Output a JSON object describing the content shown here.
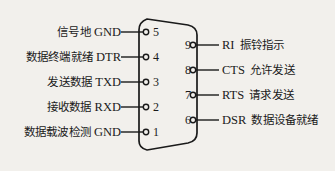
{
  "diagram": {
    "connector": {
      "shape": "d-sub-9-outline",
      "stroke_color": "#1a1a1a",
      "fill_color": "#f2f0ec"
    },
    "background_color": "#f2f0ec"
  },
  "left_pins": [
    {
      "pin": "5",
      "abbr": "GND",
      "cn": "信号地"
    },
    {
      "pin": "4",
      "abbr": "DTR",
      "cn": "数据终端就绪"
    },
    {
      "pin": "3",
      "abbr": "TXD",
      "cn": "发送数据"
    },
    {
      "pin": "2",
      "abbr": "RXD",
      "cn": "接收数据"
    },
    {
      "pin": "1",
      "abbr": "GND",
      "cn": "数据载波检测"
    }
  ],
  "right_pins": [
    {
      "pin": "9",
      "abbr": "RI",
      "cn": "振铃指示"
    },
    {
      "pin": "8",
      "abbr": "CTS",
      "cn": "允许发送"
    },
    {
      "pin": "7",
      "abbr": "RTS",
      "cn": "请求发送"
    },
    {
      "pin": "6",
      "abbr": "DSR",
      "cn": "数据设备就绪"
    }
  ]
}
